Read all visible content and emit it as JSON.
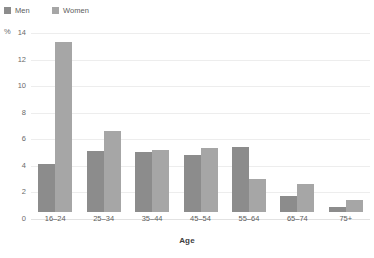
{
  "chart_data": {
    "type": "bar",
    "title": "",
    "subtitle": "",
    "xlabel": "Age",
    "ylabel": "",
    "y_unit": "%",
    "categories": [
      "16–24",
      "25–34",
      "35–44",
      "45–54",
      "55–64",
      "65–74",
      "75+"
    ],
    "series": [
      {
        "name": "Men",
        "color": "#8c8c8c",
        "values": [
          3.6,
          4.6,
          4.5,
          4.3,
          4.9,
          1.2,
          0.4
        ]
      },
      {
        "name": "Women",
        "color": "#a6a6a6",
        "values": [
          12.8,
          6.1,
          4.7,
          4.8,
          2.5,
          2.1,
          0.9
        ]
      }
    ],
    "ylim": [
      0,
      14
    ],
    "yticks": [
      0,
      2,
      4,
      6,
      8,
      10,
      12,
      14
    ],
    "ytick_labels": [
      "0",
      "2",
      "4",
      "6",
      "8",
      "10",
      "12",
      "14"
    ],
    "grid": true,
    "grid_color": "#ededed",
    "legend_position": "top-left",
    "legend": [
      "Men",
      "Women"
    ]
  }
}
